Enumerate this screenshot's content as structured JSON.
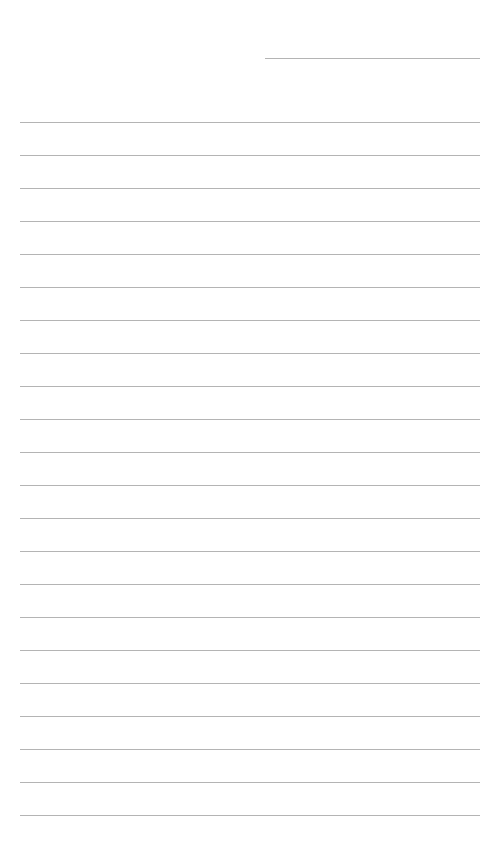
{
  "page": {
    "type": "lined-paper",
    "background_color": "#ffffff",
    "line_color": "#b4b4b4",
    "header_field": {
      "label": "",
      "value": ""
    },
    "ruled_lines": {
      "count": 22,
      "first_y": 122,
      "spacing": 33,
      "lines": [
        "",
        "",
        "",
        "",
        "",
        "",
        "",
        "",
        "",
        "",
        "",
        "",
        "",
        "",
        "",
        "",
        "",
        "",
        "",
        "",
        "",
        ""
      ]
    }
  }
}
